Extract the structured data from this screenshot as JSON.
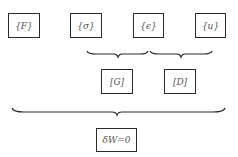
{
  "diagram": {
    "top_row": [
      {
        "id": "F",
        "label": "{F}"
      },
      {
        "id": "sigma",
        "label": "{σ}"
      },
      {
        "id": "epsilon",
        "label": "{ϵ}"
      },
      {
        "id": "u",
        "label": "{u}"
      }
    ],
    "middle_row": [
      {
        "id": "G",
        "label": "[G]"
      },
      {
        "id": "D",
        "label": "[D]"
      }
    ],
    "bottom": {
      "id": "virtual-work",
      "label": "δW=0"
    },
    "braces": [
      {
        "spans": [
          "sigma",
          "epsilon"
        ],
        "leads_to": "G"
      },
      {
        "spans": [
          "epsilon",
          "u"
        ],
        "leads_to": "D"
      },
      {
        "spans": [
          "F",
          "u"
        ],
        "leads_to": "virtual-work"
      }
    ]
  }
}
